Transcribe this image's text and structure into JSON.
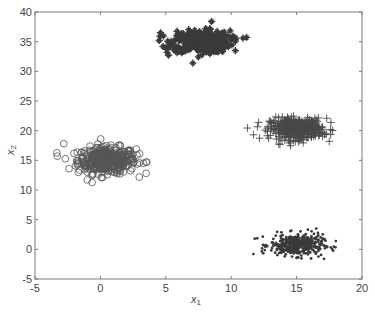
{
  "chart_data": {
    "type": "scatter",
    "title": "",
    "xlabel": "x1",
    "ylabel": "x2",
    "xlim": [
      -5,
      20
    ],
    "ylim": [
      -5,
      40
    ],
    "xticks": [
      -5,
      0,
      5,
      10,
      15,
      20
    ],
    "yticks": [
      -5,
      0,
      5,
      10,
      15,
      20,
      25,
      30,
      35,
      40
    ],
    "grid": false,
    "legend": null,
    "series": [
      {
        "name": "cluster-1",
        "marker": "circle",
        "center": [
          0.5,
          15
        ],
        "std": [
          1.1,
          1.1
        ],
        "count": 400,
        "outliers": [
          [
            -3.3,
            15.7
          ],
          [
            -2.8,
            17.8
          ],
          [
            -2.4,
            13.6
          ],
          [
            -1.0,
            11.7
          ],
          [
            3.0,
            16.1
          ],
          [
            3.3,
            14.5
          ],
          [
            3.5,
            14.7
          ],
          [
            2.0,
            14.0
          ]
        ]
      },
      {
        "name": "cluster-2",
        "marker": "star",
        "center": [
          7.7,
          35
        ],
        "std": [
          1.1,
          0.9
        ],
        "count": 400,
        "outliers": [
          [
            4.6,
            36.5
          ],
          [
            5.1,
            34.0
          ],
          [
            5.1,
            33.2
          ],
          [
            10.9,
            35.6
          ],
          [
            8.5,
            38.4
          ]
        ]
      },
      {
        "name": "cluster-3",
        "marker": "plus",
        "center": [
          15,
          20.3
        ],
        "std": [
          1.0,
          0.9
        ],
        "count": 400,
        "outliers": [
          [
            11.7,
            19.3
          ],
          [
            12.1,
            21.4
          ],
          [
            17.5,
            18.2
          ],
          [
            17.6,
            20.2
          ],
          [
            17.3,
            22.1
          ]
        ]
      },
      {
        "name": "cluster-4",
        "marker": "dot",
        "center": [
          15,
          0.7
        ],
        "std": [
          1.0,
          0.9
        ],
        "count": 400,
        "outliers": [
          [
            11.7,
            -0.8
          ],
          [
            11.8,
            1.8
          ],
          [
            18.0,
            1.4
          ],
          [
            16.5,
            3.5
          ],
          [
            17.1,
            -1.6
          ]
        ]
      }
    ]
  },
  "axes": {
    "xlabel_main": "x",
    "xlabel_sub": "1",
    "ylabel_main": "x",
    "ylabel_sub": "2"
  },
  "colors": {
    "frame": "#7a7a7a",
    "marker": "#3a3a3a",
    "circle_stroke": "#555555",
    "tick_text": "#444444"
  }
}
